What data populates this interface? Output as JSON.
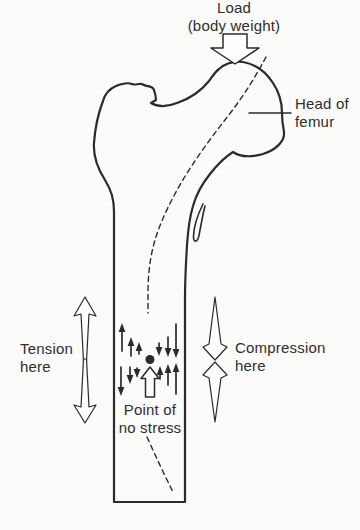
{
  "colors": {
    "background": "#fbfbf9",
    "line": "#2b2b2b",
    "text": "#2e2e2e"
  },
  "labels": {
    "load": {
      "line1": "Load",
      "line2": "(body weight)"
    },
    "head_of_femur": {
      "line1": "Head of",
      "line2": "femur"
    },
    "tension": {
      "line1": "Tension",
      "line2": "here"
    },
    "compression": {
      "line1": "Compression",
      "line2": "here"
    },
    "point_of_no_stress": {
      "line1": "Point of",
      "line2": "no stress"
    }
  },
  "icons": {
    "load_arrow": "block-arrow-down",
    "tension_arrow": "double-arrow-pointing-outward",
    "compression_arrow": "double-arrow-pointing-inward",
    "no_stress_arrow": "block-arrow-up",
    "point_of_no_stress_marker": "filled-dot"
  }
}
